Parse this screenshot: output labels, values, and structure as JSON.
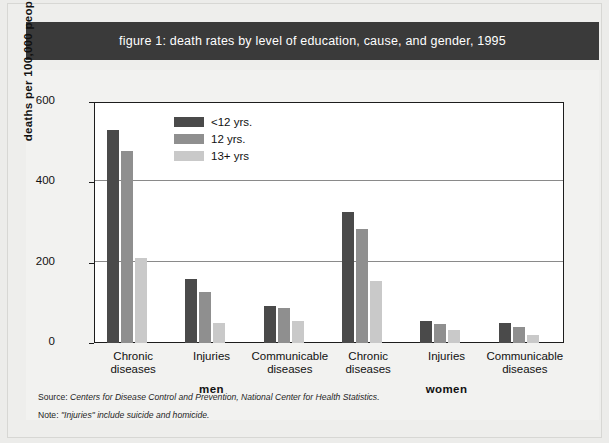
{
  "title": "figure 1: death rates by level of education, cause, and gender, 1995",
  "footnotes": {
    "source_label": "Source:",
    "source_text": "Centers for Disease Control and Prevention, National Center for Health Statistics.",
    "note_label": "Note:",
    "note_text": "\"Injuries\" include suicide and homicide."
  },
  "colors": {
    "banner_bg": "#3a3a3a",
    "banner_text": "#ffffff",
    "series_dark": "#4a4a4a",
    "series_medium": "#8f8f8f",
    "series_light": "#c9c9c9",
    "plot_bg": "#ffffff",
    "page_bg": "#f2f2f0",
    "axis": "#1d1d1d",
    "gridline": "#8a8a8a"
  },
  "chart_data": {
    "type": "bar",
    "title": "figure 1: death rates by level of education, cause, and gender, 1995",
    "xlabel": "",
    "ylabel": "deaths per 100,000 people",
    "ylim": [
      0,
      600
    ],
    "yticks": [
      0,
      200,
      400,
      600
    ],
    "ytick_labels": [
      "0",
      "200",
      "400",
      "600"
    ],
    "grid": true,
    "legend_position": "upper-left-inside",
    "groups": [
      "men",
      "women"
    ],
    "categories": [
      "Chronic diseases",
      "Injuries",
      "Communicable diseases",
      "Chronic diseases",
      "Injuries",
      "Communicable diseases"
    ],
    "category_lines": [
      [
        "Chronic",
        "diseases"
      ],
      [
        "Injuries",
        ""
      ],
      [
        "Communicable",
        "diseases"
      ],
      [
        "Chronic",
        "diseases"
      ],
      [
        "Injuries",
        ""
      ],
      [
        "Communicable",
        "diseases"
      ]
    ],
    "series": [
      {
        "name": "<12 yrs.",
        "color": "#4a4a4a",
        "values": [
          530,
          160,
          93,
          325,
          55,
          50
        ]
      },
      {
        "name": "12 yrs.",
        "color": "#8f8f8f",
        "values": [
          478,
          127,
          88,
          283,
          48,
          40
        ]
      },
      {
        "name": "13+ yrs",
        "color": "#c9c9c9",
        "values": [
          212,
          50,
          55,
          155,
          33,
          20
        ]
      }
    ]
  }
}
